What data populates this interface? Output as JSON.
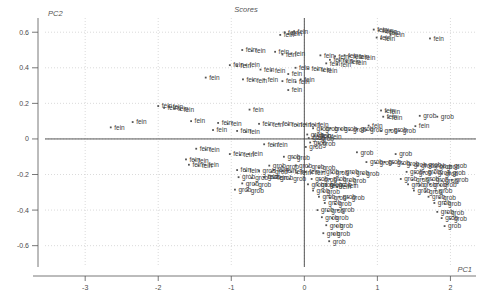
{
  "chart_data": {
    "type": "scatter",
    "title": "Scores",
    "xlabel": "PC1",
    "ylabel": "PC2",
    "xlim": [
      -3.55,
      2.35
    ],
    "ylim": [
      -0.72,
      0.68
    ],
    "xticks": [
      -3,
      -2,
      -1,
      0,
      1,
      2
    ],
    "xticklabels": [
      "-3",
      "-2",
      "-1",
      "0",
      "1",
      "2"
    ],
    "yticks": [
      -0.6,
      -0.4,
      -0.2,
      0,
      0.2,
      0.4,
      0.6
    ],
    "yticklabels": [
      "-0.6",
      "-0.4",
      "-0.2",
      "0",
      "0.2",
      "0.4",
      "0.6"
    ],
    "grid": true,
    "legend": "none",
    "point_label_groups": [
      "fein",
      "grob"
    ],
    "marker_color": "#555555",
    "grid_color": "#cccccc",
    "axis_color": "#444444",
    "series": [
      {
        "name": "fein",
        "label": "fein",
        "points": [
          [
            -0.33,
            0.585
          ],
          [
            -0.27,
            0.6
          ],
          [
            -0.22,
            0.59
          ],
          [
            -0.14,
            0.605
          ],
          [
            0.95,
            0.615
          ],
          [
            1.02,
            0.61
          ],
          [
            1.08,
            0.605
          ],
          [
            1.12,
            0.6
          ],
          [
            1.18,
            0.585
          ],
          [
            0.99,
            0.57
          ],
          [
            1.05,
            0.565
          ],
          [
            1.72,
            0.565
          ],
          [
            -0.85,
            0.5
          ],
          [
            -0.72,
            0.495
          ],
          [
            -0.4,
            0.49
          ],
          [
            -0.3,
            0.475
          ],
          [
            -0.18,
            0.48
          ],
          [
            0.22,
            0.47
          ],
          [
            0.42,
            0.465
          ],
          [
            0.55,
            0.47
          ],
          [
            0.62,
            0.465
          ],
          [
            0.7,
            0.46
          ],
          [
            0.78,
            0.455
          ],
          [
            0.35,
            0.445
          ],
          [
            0.48,
            0.44
          ],
          [
            0.58,
            0.435
          ],
          [
            0.66,
            0.43
          ],
          [
            0.3,
            0.425
          ],
          [
            0.45,
            0.42
          ],
          [
            -1.02,
            0.415
          ],
          [
            -0.92,
            0.41
          ],
          [
            -0.8,
            0.415
          ],
          [
            -0.12,
            0.4
          ],
          [
            0.05,
            0.395
          ],
          [
            0.18,
            0.39
          ],
          [
            -0.6,
            0.39
          ],
          [
            -0.45,
            0.385
          ],
          [
            0.26,
            0.385
          ],
          [
            -0.22,
            0.365
          ],
          [
            -1.35,
            0.345
          ],
          [
            -0.05,
            0.335
          ],
          [
            -0.84,
            0.335
          ],
          [
            -0.7,
            0.33
          ],
          [
            -0.55,
            0.335
          ],
          [
            -0.3,
            0.325
          ],
          [
            -0.12,
            0.32
          ],
          [
            -0.22,
            0.275
          ],
          [
            -2.0,
            0.185
          ],
          [
            -1.92,
            0.175
          ],
          [
            -1.85,
            0.18
          ],
          [
            -1.78,
            0.17
          ],
          [
            -1.7,
            0.165
          ],
          [
            -0.75,
            0.165
          ],
          [
            1.05,
            0.16
          ],
          [
            1.12,
            0.155
          ],
          [
            1.08,
            0.125
          ],
          [
            1.15,
            0.12
          ],
          [
            -2.35,
            0.095
          ],
          [
            -1.55,
            0.1
          ],
          [
            -1.18,
            0.09
          ],
          [
            -1.05,
            0.085
          ],
          [
            -0.62,
            0.085
          ],
          [
            -0.48,
            0.08
          ],
          [
            -0.35,
            0.085
          ],
          [
            -0.22,
            0.08
          ],
          [
            -0.1,
            0.078
          ],
          [
            0.02,
            0.082
          ],
          [
            0.14,
            0.078
          ],
          [
            0.88,
            0.075
          ],
          [
            1.52,
            0.072
          ],
          [
            -2.65,
            0.065
          ],
          [
            -1.25,
            0.05
          ],
          [
            -0.92,
            0.045
          ],
          [
            -0.8,
            0.04
          ],
          [
            0.18,
            0.02
          ],
          [
            0.32,
            0.015
          ],
          [
            -0.55,
            -0.03
          ],
          [
            -0.42,
            -0.035
          ],
          [
            -1.48,
            -0.055
          ],
          [
            -1.35,
            -0.06
          ],
          [
            -1.02,
            -0.085
          ],
          [
            -0.88,
            -0.09
          ],
          [
            -0.76,
            -0.085
          ],
          [
            -1.62,
            -0.115
          ],
          [
            -1.5,
            -0.12
          ],
          [
            -1.58,
            -0.145
          ],
          [
            -1.45,
            -0.15
          ],
          [
            -1.36,
            -0.145
          ],
          [
            -0.92,
            -0.175
          ],
          [
            -0.8,
            -0.18
          ],
          [
            -0.42,
            -0.175
          ],
          [
            -0.3,
            -0.18
          ],
          [
            -0.18,
            -0.185
          ],
          [
            -0.1,
            -0.19
          ],
          [
            0.02,
            -0.185
          ],
          [
            0.1,
            -0.19
          ],
          [
            -0.55,
            -0.215
          ],
          [
            -0.42,
            -0.22
          ],
          [
            0.3,
            -0.265
          ],
          [
            0.45,
            -0.27
          ],
          [
            0.55,
            -0.265
          ]
        ]
      },
      {
        "name": "grob",
        "label": "grob",
        "points": [
          [
            1.58,
            0.13
          ],
          [
            1.82,
            0.125
          ],
          [
            0.12,
            0.06
          ],
          [
            0.24,
            0.055
          ],
          [
            0.36,
            0.06
          ],
          [
            0.5,
            0.055
          ],
          [
            0.62,
            0.05
          ],
          [
            0.72,
            0.055
          ],
          [
            0.85,
            0.05
          ],
          [
            1.05,
            0.045
          ],
          [
            1.18,
            0.05
          ],
          [
            1.3,
            0.045
          ],
          [
            0.04,
            0.025
          ],
          [
            0.14,
            0.02
          ],
          [
            0.06,
            0.005
          ],
          [
            0.18,
            0.0
          ],
          [
            0.08,
            -0.02
          ],
          [
            0.2,
            -0.025
          ],
          [
            0.02,
            -0.045
          ],
          [
            0.72,
            -0.075
          ],
          [
            1.25,
            -0.085
          ],
          [
            -0.28,
            -0.1
          ],
          [
            -0.15,
            -0.105
          ],
          [
            0.85,
            -0.13
          ],
          [
            0.98,
            -0.135
          ],
          [
            1.1,
            -0.13
          ],
          [
            1.22,
            -0.135
          ],
          [
            1.35,
            -0.14
          ],
          [
            1.45,
            -0.145
          ],
          [
            1.55,
            -0.15
          ],
          [
            1.65,
            -0.145
          ],
          [
            1.72,
            -0.15
          ],
          [
            1.8,
            -0.155
          ],
          [
            -0.48,
            -0.15
          ],
          [
            -0.3,
            -0.155
          ],
          [
            -0.12,
            -0.15
          ],
          [
            0.05,
            -0.155
          ],
          [
            0.2,
            -0.16
          ],
          [
            1.9,
            -0.155
          ],
          [
            2.0,
            -0.15
          ],
          [
            -0.62,
            -0.18
          ],
          [
            -0.45,
            -0.185
          ],
          [
            0.25,
            -0.185
          ],
          [
            0.38,
            -0.19
          ],
          [
            0.52,
            -0.185
          ],
          [
            0.66,
            -0.19
          ],
          [
            0.8,
            -0.195
          ],
          [
            1.4,
            -0.185
          ],
          [
            1.52,
            -0.19
          ],
          [
            1.64,
            -0.185
          ],
          [
            1.78,
            -0.19
          ],
          [
            1.88,
            -0.195
          ],
          [
            1.98,
            -0.19
          ],
          [
            -0.9,
            -0.215
          ],
          [
            -0.72,
            -0.22
          ],
          [
            -0.55,
            -0.215
          ],
          [
            -0.38,
            -0.22
          ],
          [
            -0.2,
            -0.225
          ],
          [
            0.1,
            -0.225
          ],
          [
            0.22,
            -0.23
          ],
          [
            0.35,
            -0.225
          ],
          [
            0.48,
            -0.23
          ],
          [
            0.62,
            -0.235
          ],
          [
            1.32,
            -0.225
          ],
          [
            1.48,
            -0.23
          ],
          [
            1.62,
            -0.225
          ],
          [
            1.75,
            -0.23
          ],
          [
            1.88,
            -0.235
          ],
          [
            2.02,
            -0.23
          ],
          [
            -0.85,
            -0.25
          ],
          [
            -0.68,
            -0.255
          ],
          [
            0.05,
            -0.255
          ],
          [
            0.18,
            -0.26
          ],
          [
            0.3,
            -0.255
          ],
          [
            0.42,
            -0.26
          ],
          [
            1.42,
            -0.255
          ],
          [
            1.58,
            -0.26
          ],
          [
            1.72,
            -0.255
          ],
          [
            1.86,
            -0.26
          ],
          [
            -0.95,
            -0.285
          ],
          [
            -0.78,
            -0.29
          ],
          [
            0.12,
            -0.29
          ],
          [
            0.26,
            -0.295
          ],
          [
            1.5,
            -0.29
          ],
          [
            1.66,
            -0.295
          ],
          [
            1.8,
            -0.29
          ],
          [
            0.2,
            -0.325
          ],
          [
            0.35,
            -0.33
          ],
          [
            0.48,
            -0.325
          ],
          [
            0.6,
            -0.33
          ],
          [
            1.7,
            -0.325
          ],
          [
            1.85,
            -0.33
          ],
          [
            0.28,
            -0.36
          ],
          [
            0.42,
            -0.365
          ],
          [
            1.78,
            -0.36
          ],
          [
            1.92,
            -0.365
          ],
          [
            0.18,
            -0.4
          ],
          [
            0.32,
            -0.405
          ],
          [
            0.46,
            -0.4
          ],
          [
            1.82,
            -0.41
          ],
          [
            1.96,
            -0.415
          ],
          [
            0.24,
            -0.44
          ],
          [
            0.38,
            -0.445
          ],
          [
            1.88,
            -0.445
          ],
          [
            2.0,
            -0.45
          ],
          [
            0.3,
            -0.485
          ],
          [
            0.44,
            -0.49
          ],
          [
            1.92,
            -0.49
          ],
          [
            0.26,
            -0.53
          ],
          [
            0.4,
            -0.535
          ],
          [
            0.34,
            -0.575
          ]
        ]
      }
    ]
  },
  "plot": {
    "title": "Scores",
    "x_axis_label": "PC1",
    "y_axis_label": "PC2"
  }
}
